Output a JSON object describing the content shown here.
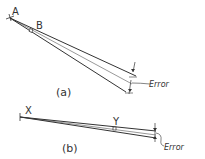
{
  "figure_a": {
    "point_a": "A",
    "point_b": "B",
    "error_label": "Error",
    "caption": "(a)"
  },
  "figure_b": {
    "point_x": "X",
    "point_y": "Y",
    "error_label": "Error",
    "caption": "(b)"
  },
  "colors": {
    "stroke": "#333333",
    "background": "#ffffff"
  }
}
